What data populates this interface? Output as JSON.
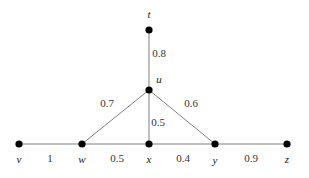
{
  "figure": {
    "type": "weighted-graph",
    "width": 309,
    "height": 178,
    "background_color": "#ffffff",
    "node_color": "#000000",
    "edge_color": "#808080",
    "label_color": "#1a1a1a"
  },
  "chart_data": {
    "type": "diagram",
    "title": "",
    "xlabel": "",
    "ylabel": "",
    "nodes": [
      {
        "id": "t",
        "label": "t",
        "x": 149,
        "y": 30,
        "label_x": 149,
        "label_y": 14
      },
      {
        "id": "u",
        "label": "u",
        "x": 149,
        "y": 90,
        "label_x": 159,
        "label_y": 79
      },
      {
        "id": "v",
        "label": "v",
        "x": 19,
        "y": 144,
        "label_x": 19,
        "label_y": 159
      },
      {
        "id": "w",
        "label": "w",
        "x": 82,
        "y": 144,
        "label_x": 82,
        "label_y": 159
      },
      {
        "id": "x",
        "label": "x",
        "x": 149,
        "y": 144,
        "label_x": 149,
        "label_y": 159
      },
      {
        "id": "y",
        "label": "y",
        "x": 215,
        "y": 144,
        "label_x": 215,
        "label_y": 160
      },
      {
        "id": "z",
        "label": "z",
        "x": 287,
        "y": 144,
        "label_x": 287,
        "label_y": 159
      }
    ],
    "edges": [
      {
        "from": "t",
        "to": "u",
        "weight": "0.8",
        "label_x": 159,
        "label_y": 53
      },
      {
        "from": "u",
        "to": "w",
        "weight": "0.7",
        "label_x": 107,
        "label_y": 103
      },
      {
        "from": "u",
        "to": "x",
        "weight": "0.5",
        "label_x": 158,
        "label_y": 122
      },
      {
        "from": "u",
        "to": "y",
        "weight": "0.6",
        "label_x": 191,
        "label_y": 103
      },
      {
        "from": "v",
        "to": "w",
        "weight": "1",
        "label_x": 50,
        "label_y": 158
      },
      {
        "from": "w",
        "to": "x",
        "weight": "0.5",
        "label_x": 117,
        "label_y": 158
      },
      {
        "from": "x",
        "to": "y",
        "weight": "0.4",
        "label_x": 183,
        "label_y": 158
      },
      {
        "from": "y",
        "to": "z",
        "weight": "0.9",
        "label_x": 251,
        "label_y": 158
      }
    ]
  }
}
